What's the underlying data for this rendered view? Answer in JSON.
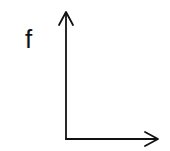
{
  "diagram": {
    "type": "axes",
    "y_axis_label": "f",
    "x_axis_label": "",
    "stroke_color": "#111111",
    "background": "#ffffff"
  }
}
